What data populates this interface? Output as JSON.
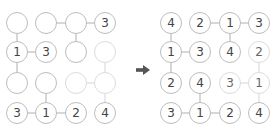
{
  "colors": {
    "stroke": "#bdbdbd",
    "stroke_faint": "#dcdcdc",
    "text": "#444444",
    "arrow": "#555555"
  },
  "layout": {
    "col_x": [
      17,
      46,
      76,
      105
    ],
    "row_y": [
      23,
      52,
      83,
      113
    ],
    "h_edges": [
      [
        0,
        1
      ],
      [
        0,
        2
      ],
      [
        1,
        0
      ],
      [
        2,
        2
      ],
      [
        3,
        0
      ],
      [
        3,
        1
      ]
    ],
    "v_edges": [
      [
        0,
        0
      ],
      [
        0,
        2
      ],
      [
        1,
        0
      ],
      [
        1,
        3
      ],
      [
        2,
        1
      ],
      [
        2,
        3
      ]
    ],
    "faint": [
      [
        1,
        3
      ],
      [
        2,
        2
      ],
      [
        2,
        3
      ]
    ]
  },
  "puzzle": {
    "grid": [
      [
        "",
        "",
        "",
        "3"
      ],
      [
        "1",
        "3",
        "",
        ""
      ],
      [
        "",
        "",
        "",
        ""
      ],
      [
        "3",
        "1",
        "2",
        "4"
      ]
    ]
  },
  "solution": {
    "grid": [
      [
        "4",
        "2",
        "1",
        "3"
      ],
      [
        "1",
        "3",
        "4",
        "2"
      ],
      [
        "2",
        "4",
        "3",
        "1"
      ],
      [
        "3",
        "1",
        "2",
        "4"
      ]
    ]
  },
  "arrow_icon": "right-arrow-icon"
}
